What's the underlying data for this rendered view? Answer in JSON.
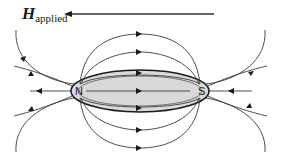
{
  "diagram": {
    "title_symbol": "H",
    "title_subscript": "applied",
    "applied_field_direction": "left",
    "body_shape": "ellipsoid",
    "body_fill": "#d9d9d9",
    "pole_left": "N",
    "pole_right": "S",
    "internal_field_direction": "N to S (rightward)",
    "line_color": "#3a3a3a"
  }
}
